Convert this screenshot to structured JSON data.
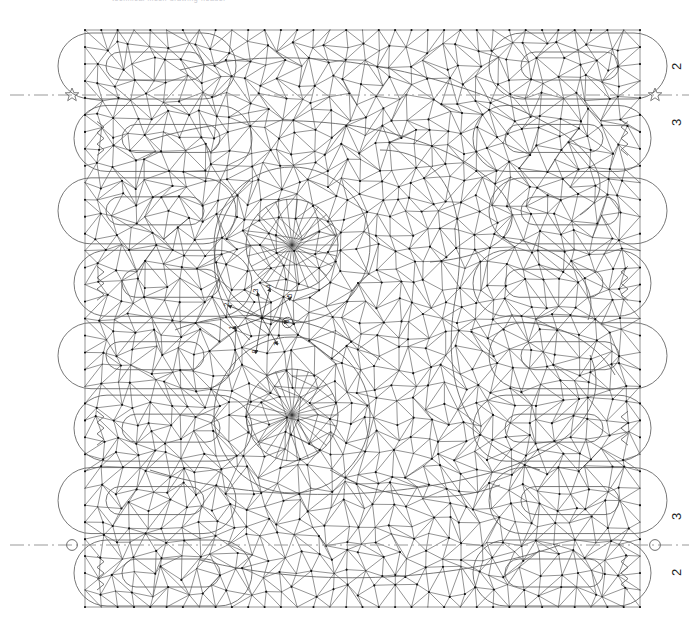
{
  "header": {
    "caption": "technical mesh drawing header"
  },
  "canvas": {
    "width": 699,
    "height": 620,
    "background": "#ffffff",
    "mesh_line_color": "#3a3a3a",
    "node_color": "#111111",
    "axis_color": "#9a9a9a",
    "region_outline_color": "#555555"
  },
  "axes": [
    {
      "id": "top-symmetry-axis",
      "orientation": "horizontal",
      "y": 95,
      "style": "dash-dot",
      "left_marker": "star-marker",
      "right_marker": "star-marker",
      "labels": {
        "above": "2",
        "below": "3"
      }
    },
    {
      "id": "bottom-symmetry-axis",
      "orientation": "horizontal",
      "y": 545,
      "style": "dash-dot",
      "left_marker": "circle-marker",
      "right_marker": "circle-marker",
      "labels": {
        "above": "3",
        "below": "2"
      }
    }
  ],
  "markers": {
    "star_label": "star datum marker",
    "circle_label": "circle datum marker"
  },
  "rosette": {
    "center_x": 262,
    "center_y": 318,
    "label": "direction rosette",
    "items": [
      {
        "n": "1",
        "angle": 200,
        "circled": false
      },
      {
        "n": "2",
        "angle": 160,
        "circled": false
      },
      {
        "n": "3",
        "angle": 100,
        "circled": false
      },
      {
        "n": "4",
        "angle": 75,
        "circled": false
      },
      {
        "n": "5",
        "angle": 35,
        "circled": false
      },
      {
        "n": "6",
        "angle": 350,
        "circled": true
      },
      {
        "n": "7",
        "angle": 300,
        "circled": false
      },
      {
        "n": "8",
        "angle": 260,
        "circled": false
      }
    ]
  },
  "mesh": {
    "type": "triangulated-finite-element-mesh",
    "domain_left": 85,
    "domain_right": 640,
    "domain_top": 30,
    "domain_bottom": 607,
    "description": "interlocking lobed sub-regions with triangular elements and nodal points"
  }
}
